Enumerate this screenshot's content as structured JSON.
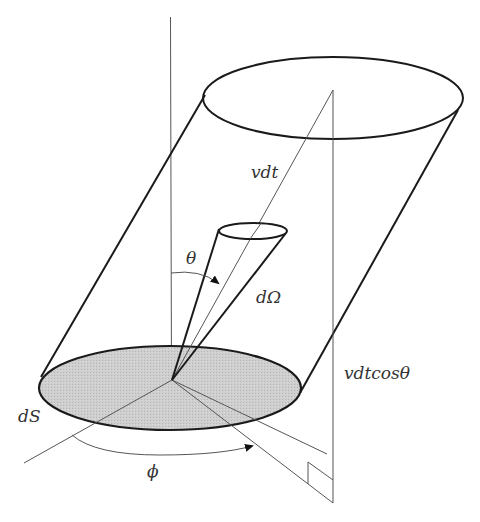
{
  "diagram": {
    "labels": {
      "vdt": "vdt",
      "theta": "θ",
      "dOmega": "dΩ",
      "vdtcos": "vdtcosθ",
      "dS": "dS",
      "phi": "ϕ"
    },
    "colors": {
      "stroke": "#1a1a1a",
      "thin_stroke": "#555555",
      "disk_fill": "#c8c8c8",
      "background": "#ffffff"
    },
    "geometry": {
      "origin": [
        172,
        380
      ],
      "top_ellipse": {
        "cx": 333,
        "cy": 98,
        "rx": 130,
        "ry": 41
      },
      "base_disk": {
        "cx": 170,
        "cy": 388,
        "rx": 131,
        "ry": 42
      },
      "cone_ellipse": {
        "cx": 253,
        "cy": 231,
        "rx": 34,
        "ry": 8
      }
    }
  }
}
